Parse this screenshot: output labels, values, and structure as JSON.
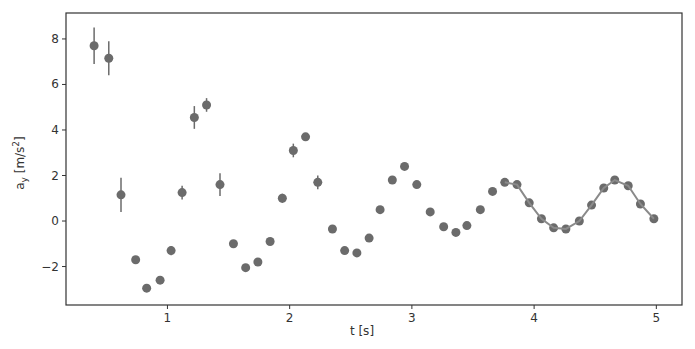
{
  "chart_data": {
    "type": "scatter",
    "title": "",
    "xlabel": "t [s]",
    "ylabel": "a_y [m/s^2]",
    "xlim": [
      0.17,
      5.21
    ],
    "ylim": [
      -3.69,
      9.14
    ],
    "xticks": [
      1,
      2,
      3,
      4,
      5
    ],
    "yticks": [
      -2,
      0,
      2,
      4,
      6,
      8
    ],
    "grid": false,
    "legend": null,
    "colors": {
      "points": "#6b6b6b",
      "fit_line": "#8a8a8a",
      "axes": "#333333"
    },
    "series": [
      {
        "name": "measured",
        "kind": "errorbar",
        "x": [
          0.4,
          0.52,
          0.62,
          0.74,
          0.83,
          0.94,
          1.03,
          1.12,
          1.22,
          1.32,
          1.43,
          1.54,
          1.64,
          1.74,
          1.84,
          1.94,
          2.03,
          2.13,
          2.23,
          2.35,
          2.45,
          2.55,
          2.65,
          2.74,
          2.84,
          2.94,
          3.04,
          3.15,
          3.26,
          3.36,
          3.45,
          3.56,
          3.66,
          3.76,
          3.86,
          3.96,
          4.06,
          4.16,
          4.26,
          4.37,
          4.47,
          4.57,
          4.66,
          4.77,
          4.87,
          4.98
        ],
        "y": [
          7.7,
          7.15,
          1.15,
          -1.7,
          -2.95,
          -2.6,
          -1.3,
          1.25,
          4.55,
          5.1,
          1.6,
          -1.0,
          -2.05,
          -1.8,
          -0.9,
          1.0,
          3.1,
          3.7,
          1.7,
          -0.35,
          -1.3,
          -1.4,
          -0.75,
          0.5,
          1.8,
          2.4,
          1.6,
          0.4,
          -0.25,
          -0.5,
          -0.2,
          0.5,
          1.3,
          1.7,
          1.6,
          0.8,
          0.1,
          -0.3,
          -0.35,
          0.0,
          0.7,
          1.45,
          1.8,
          1.55,
          0.75,
          0.1
        ],
        "yerr": [
          0.8,
          0.75,
          0.75,
          0.1,
          0.05,
          0.05,
          0.2,
          0.3,
          0.5,
          0.3,
          0.5,
          0.05,
          0.05,
          0.05,
          0.1,
          0.2,
          0.3,
          0.1,
          0.3,
          0.05,
          0.05,
          0.05,
          0.05,
          0.05,
          0.05,
          0.05,
          0.05,
          0.05,
          0.05,
          0.05,
          0.05,
          0.05,
          0.05,
          0.05,
          0.05,
          0.05,
          0.05,
          0.05,
          0.05,
          0.05,
          0.05,
          0.05,
          0.05,
          0.05,
          0.05,
          0.05
        ]
      },
      {
        "name": "fit",
        "kind": "line",
        "x": [
          3.76,
          3.86,
          3.96,
          4.06,
          4.16,
          4.26,
          4.37,
          4.47,
          4.57,
          4.66,
          4.77,
          4.87,
          4.98
        ],
        "y": [
          1.7,
          1.6,
          0.8,
          0.1,
          -0.3,
          -0.35,
          0.0,
          0.7,
          1.45,
          1.8,
          1.55,
          0.75,
          0.1
        ]
      }
    ]
  },
  "labels": {
    "xlabel": "t [s]",
    "ylabel_main": "a",
    "ylabel_sub": "y",
    "ylabel_unit": " [m/s",
    "ylabel_sup": "2",
    "ylabel_close": "]"
  }
}
